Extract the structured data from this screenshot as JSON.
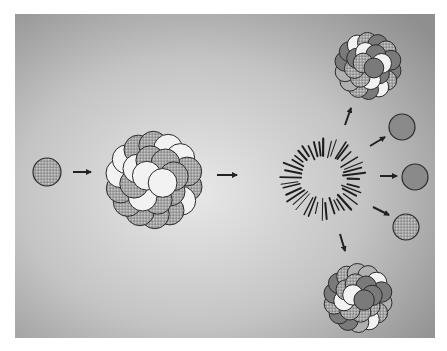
{
  "diagram": {
    "title": "",
    "background": {
      "panel": {
        "x": 15,
        "y": 14,
        "w": 420,
        "h": 324
      },
      "center_color": "#e6e6e6",
      "edge_color": "#8e8e8e"
    },
    "colors": {
      "proton_fill": "#9a9a9a",
      "proton_dark_fill": "#7a7a7a",
      "neutron_fill": "#f2f2f2",
      "outline": "#2a2a2a",
      "arrow": "#222222",
      "burst": "#1e1e1e"
    },
    "incoming_neutron": {
      "cx": 47,
      "cy": 172,
      "r": 14
    },
    "target_nucleus": {
      "cx": 154,
      "cy": 180,
      "r": 48
    },
    "burst": {
      "cx": 323,
      "cy": 178,
      "inner_r": 20,
      "outer_r": 43,
      "rays": 40
    },
    "fragments": [
      {
        "name": "fragment-top",
        "cx": 368,
        "cy": 66,
        "r": 33
      },
      {
        "name": "fragment-bottom",
        "cx": 358,
        "cy": 298,
        "r": 34
      }
    ],
    "released_neutrons": [
      {
        "cx": 402,
        "cy": 127,
        "r": 13,
        "pattern": "solid"
      },
      {
        "cx": 415,
        "cy": 177,
        "r": 13,
        "pattern": "solid"
      },
      {
        "cx": 406,
        "cy": 227,
        "r": 13,
        "pattern": "dotted"
      }
    ],
    "arrows": [
      {
        "name": "arrow-neutron-to-nucleus",
        "x1": 73,
        "y1": 172,
        "x2": 91,
        "y2": 172
      },
      {
        "name": "arrow-nucleus-to-burst",
        "x1": 217,
        "y1": 175,
        "x2": 237,
        "y2": 175
      },
      {
        "name": "arrow-to-fragment-top",
        "x1": 345,
        "y1": 125,
        "x2": 351,
        "y2": 108
      },
      {
        "name": "arrow-to-neutron-1",
        "x1": 370,
        "y1": 146,
        "x2": 385,
        "y2": 137
      },
      {
        "name": "arrow-to-neutron-2",
        "x1": 380,
        "y1": 176,
        "x2": 397,
        "y2": 176
      },
      {
        "name": "arrow-to-neutron-3",
        "x1": 373,
        "y1": 207,
        "x2": 389,
        "y2": 215
      },
      {
        "name": "arrow-to-fragment-bottom",
        "x1": 340,
        "y1": 234,
        "x2": 345,
        "y2": 251
      }
    ],
    "labels": []
  }
}
